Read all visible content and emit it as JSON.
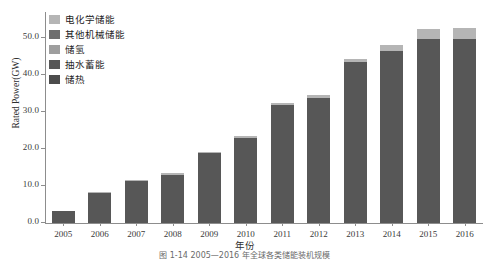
{
  "chart_data": {
    "type": "bar",
    "stacked": true,
    "title": "",
    "xlabel": "年份",
    "ylabel": "Rated Power(GW)",
    "ylim": [
      0,
      57
    ],
    "ytick_values": [
      0.0,
      10.0,
      20.0,
      30.0,
      40.0,
      50.0
    ],
    "ytick_labels": [
      "0.0",
      "10.0",
      "20.0",
      "30.0",
      "40.0",
      "50.0"
    ],
    "grid": false,
    "legend_position": "upper-left",
    "categories": [
      "2005",
      "2006",
      "2007",
      "2008",
      "2009",
      "2010",
      "2011",
      "2012",
      "2013",
      "2014",
      "2015",
      "2016"
    ],
    "series": [
      {
        "name": "储热",
        "color": "#4c4c4c",
        "values": [
          0.0,
          0.0,
          0.0,
          0.0,
          0.0,
          0.0,
          0.0,
          0.0,
          0.0,
          0.0,
          0.0,
          0.0
        ]
      },
      {
        "name": "抽水蓄能",
        "color": "#575757",
        "values": [
          3.2,
          8.2,
          11.3,
          13.0,
          18.8,
          23.1,
          31.8,
          33.9,
          43.4,
          46.5,
          49.6,
          49.6
        ]
      },
      {
        "name": "储氢",
        "color": "#9e9e9e",
        "values": [
          0.0,
          0.0,
          0.0,
          0.0,
          0.0,
          0.0,
          0.0,
          0.0,
          0.0,
          0.0,
          0.0,
          0.0
        ]
      },
      {
        "name": "其他机械储能",
        "color": "#6e6e6e",
        "values": [
          0.0,
          0.0,
          0.0,
          0.0,
          0.0,
          0.0,
          0.0,
          0.0,
          0.0,
          0.0,
          0.0,
          0.0
        ]
      },
      {
        "name": "电化学储能",
        "color": "#b5b5b5",
        "values": [
          0.0,
          0.3,
          0.3,
          0.4,
          0.4,
          0.5,
          0.6,
          0.8,
          1.0,
          1.6,
          2.8,
          3.2
        ]
      }
    ],
    "totals": [
      3.2,
      8.5,
      11.6,
      13.4,
      19.2,
      23.6,
      32.4,
      34.7,
      44.4,
      48.1,
      52.4,
      52.8
    ],
    "annotations": []
  },
  "legend": {
    "items": [
      {
        "label": "电化学储能",
        "color": "#b5b5b5"
      },
      {
        "label": "其他机械储能",
        "color": "#6e6e6e"
      },
      {
        "label": "储氢",
        "color": "#9e9e9e"
      },
      {
        "label": "抽水蓄能",
        "color": "#575757"
      },
      {
        "label": "储热",
        "color": "#4c4c4c"
      }
    ]
  },
  "caption": {
    "text": "图 1-14  2005—2016 年全球各类储能装机规模"
  },
  "colors": {
    "axis": "#8d8d8d",
    "text": "#2f2f2f",
    "background": "#ffffff"
  }
}
